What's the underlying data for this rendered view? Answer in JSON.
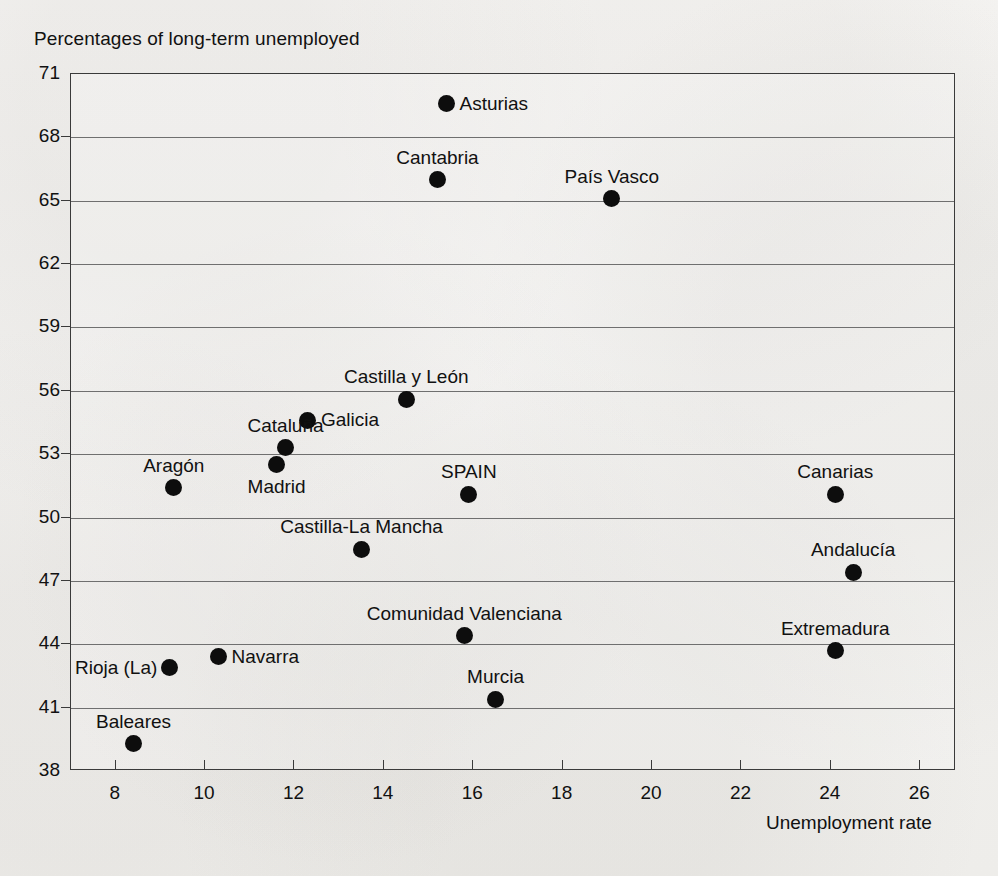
{
  "chart_data": {
    "type": "scatter",
    "title": "Percentages of long-term unemployed",
    "xlabel": "Unemployment rate",
    "ylabel": "",
    "xlim": [
      7.0,
      26.8
    ],
    "ylim": [
      38,
      71
    ],
    "xticks": [
      8,
      10,
      12,
      14,
      16,
      18,
      20,
      22,
      24,
      26
    ],
    "yticks": [
      38,
      41,
      44,
      47,
      50,
      53,
      56,
      59,
      62,
      65,
      68,
      71
    ],
    "grid": "horizontal",
    "legend": "none",
    "point_marker": "filled-circle",
    "points": [
      {
        "label": "Asturias",
        "x": 15.4,
        "y": 69.6,
        "label_pos": "right"
      },
      {
        "label": "Cantabria",
        "x": 15.2,
        "y": 66.0,
        "label_pos": "above"
      },
      {
        "label": "País Vasco",
        "x": 19.1,
        "y": 65.1,
        "label_pos": "above"
      },
      {
        "label": "Castilla y León",
        "x": 14.5,
        "y": 55.6,
        "label_pos": "above"
      },
      {
        "label": "Galicia",
        "x": 12.3,
        "y": 54.6,
        "label_pos": "right"
      },
      {
        "label": "Cataluña",
        "x": 11.8,
        "y": 53.3,
        "label_pos": "above"
      },
      {
        "label": "Madrid",
        "x": 11.6,
        "y": 52.5,
        "label_pos": "below"
      },
      {
        "label": "Aragón",
        "x": 9.3,
        "y": 51.4,
        "label_pos": "above"
      },
      {
        "label": "SPAIN",
        "x": 15.9,
        "y": 51.1,
        "label_pos": "above"
      },
      {
        "label": "Canarias",
        "x": 24.1,
        "y": 51.1,
        "label_pos": "above"
      },
      {
        "label": "Castilla-La Mancha",
        "x": 13.5,
        "y": 48.5,
        "label_pos": "above"
      },
      {
        "label": "Andalucía",
        "x": 24.5,
        "y": 47.4,
        "label_pos": "above"
      },
      {
        "label": "Comunidad Valenciana",
        "x": 15.8,
        "y": 44.4,
        "label_pos": "above"
      },
      {
        "label": "Extremadura",
        "x": 24.1,
        "y": 43.7,
        "label_pos": "above"
      },
      {
        "label": "Navarra",
        "x": 10.3,
        "y": 43.4,
        "label_pos": "right"
      },
      {
        "label": "Rioja (La)",
        "x": 9.2,
        "y": 42.9,
        "label_pos": "left"
      },
      {
        "label": "Murcia",
        "x": 16.5,
        "y": 41.4,
        "label_pos": "above"
      },
      {
        "label": "Baleares",
        "x": 8.4,
        "y": 39.3,
        "label_pos": "above"
      }
    ]
  }
}
